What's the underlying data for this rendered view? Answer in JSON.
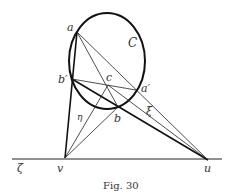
{
  "figure": {
    "caption": "Fig. 30",
    "labels": {
      "a": "a",
      "b_prime": "b′",
      "c": "c",
      "a_prime": "a′",
      "b": "b",
      "C": "C",
      "eta": "η",
      "xi": "ξ",
      "zeta": "ζ",
      "v": "v",
      "u": "u"
    }
  }
}
